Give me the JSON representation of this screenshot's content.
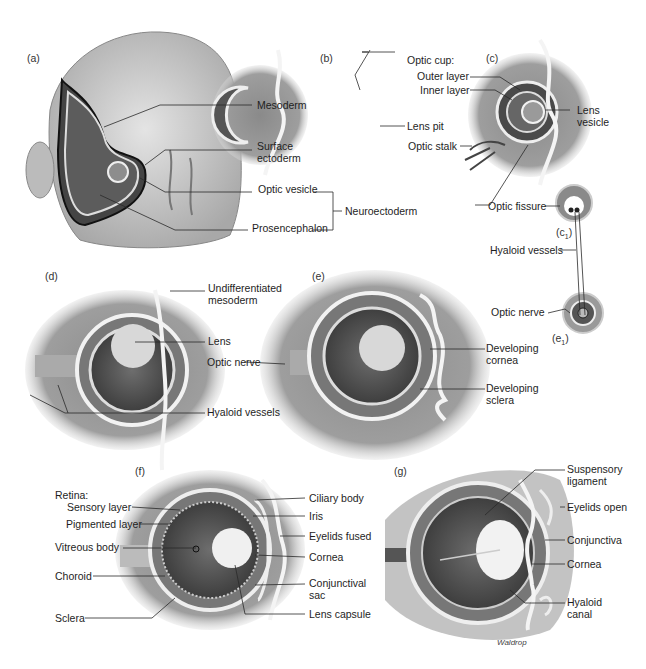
{
  "figure": {
    "credit": "Waldrop"
  },
  "panels": {
    "a": {
      "tag": "(a)",
      "labels": [
        "Mesoderm",
        "Surface",
        "ectoderm",
        "Optic vesicle",
        "Prosencephalon",
        "Neuroectoderm"
      ]
    },
    "b": {
      "tag": "(b)",
      "labels": [
        "Optic cup:",
        "Lens pit"
      ]
    },
    "c": {
      "tag": "(c)",
      "labels": [
        "Outer layer",
        "Inner layer",
        "Lens",
        "vesicle",
        "Optic stalk",
        "Optic fissure"
      ]
    },
    "c1": {
      "tag": "(c",
      "sub": "1",
      "close": ")"
    },
    "hyaloid_shared": {
      "label": "Hyaloid vessels"
    },
    "e1": {
      "tag": "(e",
      "sub": "1",
      "close": ")",
      "labels": [
        "Optic nerve"
      ]
    },
    "d": {
      "tag": "(d)",
      "labels": [
        "Undifferentiated",
        "mesoderm",
        "Lens",
        "Optic nerve",
        "Hyaloid vessels"
      ]
    },
    "e": {
      "tag": "(e)",
      "labels": [
        "Developing",
        "cornea",
        "Developing",
        "sclera"
      ]
    },
    "f": {
      "tag": "(f)",
      "labels": [
        "Retina:",
        "Sensory layer",
        "Pigmented layer",
        "Vitreous body",
        "Choroid",
        "Sclera",
        "Ciliary body",
        "Iris",
        "Eyelids fused",
        "Cornea",
        "Conjunctival",
        "sac",
        "Lens capsule"
      ]
    },
    "g": {
      "tag": "(g)",
      "labels": [
        "Suspensory",
        "ligament",
        "Eyelids open",
        "Conjunctiva",
        "Cornea",
        "Hyaloid",
        "canal"
      ]
    }
  },
  "colors": {
    "line": "#2a2a2a",
    "tissue_dark": "#5a5a5a",
    "tissue_mid": "#9a9a9a",
    "tissue_light": "#cfcfcf",
    "membrane": "#f2f2f2"
  }
}
